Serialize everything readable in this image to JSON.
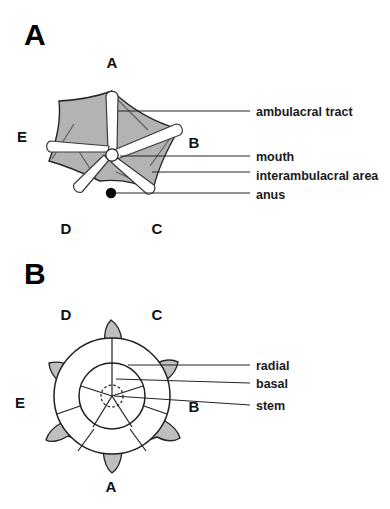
{
  "figure": {
    "panels": [
      {
        "id": "panel-a",
        "letter": "A",
        "view_name": "oral-surface-view",
        "ray_labels": [
          {
            "name": "ray-label-a",
            "text": "A",
            "x": 112,
            "y": 68
          },
          {
            "name": "ray-label-b",
            "text": "B",
            "x": 194,
            "y": 148
          },
          {
            "name": "ray-label-c",
            "text": "C",
            "x": 157,
            "y": 234
          },
          {
            "name": "ray-label-d",
            "text": "D",
            "x": 66,
            "y": 234
          },
          {
            "name": "ray-label-e",
            "text": "E",
            "x": 22,
            "y": 142
          }
        ],
        "callouts": [
          {
            "name": "callout-ambulacral-tract",
            "text": "ambulacral tract",
            "text_x": 256,
            "text_y": 116,
            "line_x1": 118,
            "line_y1": 111,
            "line_x2": 250,
            "line_y2": 111
          },
          {
            "name": "callout-mouth",
            "text": "mouth",
            "text_x": 256,
            "text_y": 159,
            "line_x1": 120,
            "line_y1": 156,
            "line_x2": 250,
            "line_y2": 156
          },
          {
            "name": "callout-interambulacral-area",
            "text": "interambulacral area",
            "text_x": 256,
            "text_y": 178,
            "line_x1": 152,
            "line_y1": 172,
            "line_x2": 250,
            "line_y2": 172
          },
          {
            "name": "callout-anus",
            "text": "anus",
            "text_x": 256,
            "text_y": 200,
            "line_x1": 116,
            "line_y1": 193,
            "line_x2": 250,
            "line_y2": 193
          }
        ],
        "anus_marker": {
          "cx": 111,
          "cy": 193,
          "r": 5.2
        },
        "mouth": {
          "cx": 112,
          "cy": 155,
          "r": 6.2
        }
      },
      {
        "id": "panel-b",
        "letter": "B",
        "view_name": "aboral-surface-view",
        "ray_labels": [
          {
            "name": "ray-label-d",
            "text": "D",
            "x": 66,
            "y": 65
          },
          {
            "name": "ray-label-c",
            "text": "C",
            "x": 157,
            "y": 65
          },
          {
            "name": "ray-label-e",
            "text": "E",
            "x": 20,
            "y": 153
          },
          {
            "name": "ray-label-b",
            "text": "B",
            "x": 194,
            "y": 157
          },
          {
            "name": "ray-label-a",
            "text": "A",
            "x": 111,
            "y": 237
          }
        ],
        "callouts": [
          {
            "name": "callout-radial",
            "text": "radial",
            "text_x": 256,
            "text_y": 114,
            "line_x1": 128,
            "line_y1": 110,
            "line_x2": 250,
            "line_y2": 110
          },
          {
            "name": "callout-basal",
            "text": "basal",
            "text_x": 256,
            "text_y": 134,
            "line_x1": 116,
            "line_y1": 124,
            "line_x2": 250,
            "line_y2": 128
          },
          {
            "name": "callout-stem",
            "text": "stem",
            "text_x": 256,
            "text_y": 155,
            "line_x1": 114,
            "line_y1": 141,
            "line_x2": 250,
            "line_y2": 150
          }
        ],
        "stem_circle": {
          "cx": 112,
          "cy": 141,
          "r": 11
        }
      }
    ],
    "colors": {
      "body_fill": "#b3b3b3",
      "calyx_fill": "#bfbfbf",
      "tract_fill": "#ffffff",
      "outline": "#262626",
      "text": "#1a1a1a",
      "background": "#ffffff"
    }
  }
}
